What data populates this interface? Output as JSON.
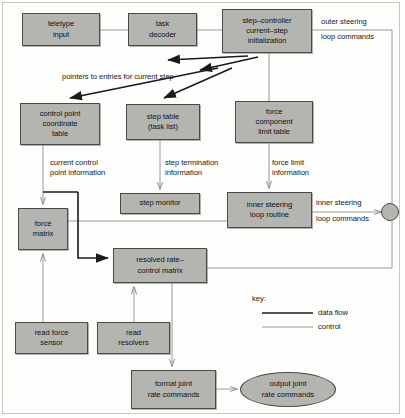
{
  "diagram": {
    "colors": {
      "node_fill": "#b4b4b0",
      "node_stroke": "#4a4a48",
      "data_flow": "#1a1a1a",
      "control": "#9a9a96",
      "background": "#fdfdfc"
    },
    "nodes": [
      {
        "id": "teletype",
        "label": "teletype\ninput"
      },
      {
        "id": "task_decoder",
        "label": "task\ndecoder"
      },
      {
        "id": "step_controller",
        "label": "step–controller\ncurrent–step\ninitialization"
      },
      {
        "id": "control_point",
        "label": "control point\ncoordinate\ntable"
      },
      {
        "id": "step_table",
        "label": "step table\n(task list)"
      },
      {
        "id": "force_limit",
        "label": "force\ncomponent\nlimit table"
      },
      {
        "id": "force_matrix",
        "label": "force\nmatrix"
      },
      {
        "id": "step_monitor",
        "label": "step monitor"
      },
      {
        "id": "inner_loop",
        "label": "inner steering\nloop routine"
      },
      {
        "id": "resolved_rate",
        "label": "resolved rate–\ncontrol matrix"
      },
      {
        "id": "read_force",
        "label": "read force\nsensor"
      },
      {
        "id": "read_resolvers",
        "label": "read\nresolvers"
      },
      {
        "id": "format_joint",
        "label": "format joint\nrate commands"
      },
      {
        "id": "output_joint",
        "label": "output joint\nrate commands"
      }
    ],
    "edge_labels": [
      {
        "id": "outer_steering",
        "line1": "outer steering",
        "line2": "loop commands"
      },
      {
        "id": "pointers",
        "text": "pointers to entries for current step"
      },
      {
        "id": "current_control",
        "text": "current control\npoint information"
      },
      {
        "id": "step_termination",
        "text": "step termination\ninformation"
      },
      {
        "id": "force_limit_info",
        "text": "force limit\ninformation"
      },
      {
        "id": "inner_steering",
        "line1": "inner steering",
        "line2": "loop commands"
      }
    ],
    "key": {
      "title": "key:",
      "items": [
        {
          "id": "data-flow",
          "label": "data flow"
        },
        {
          "id": "control",
          "label": "control"
        }
      ]
    }
  }
}
